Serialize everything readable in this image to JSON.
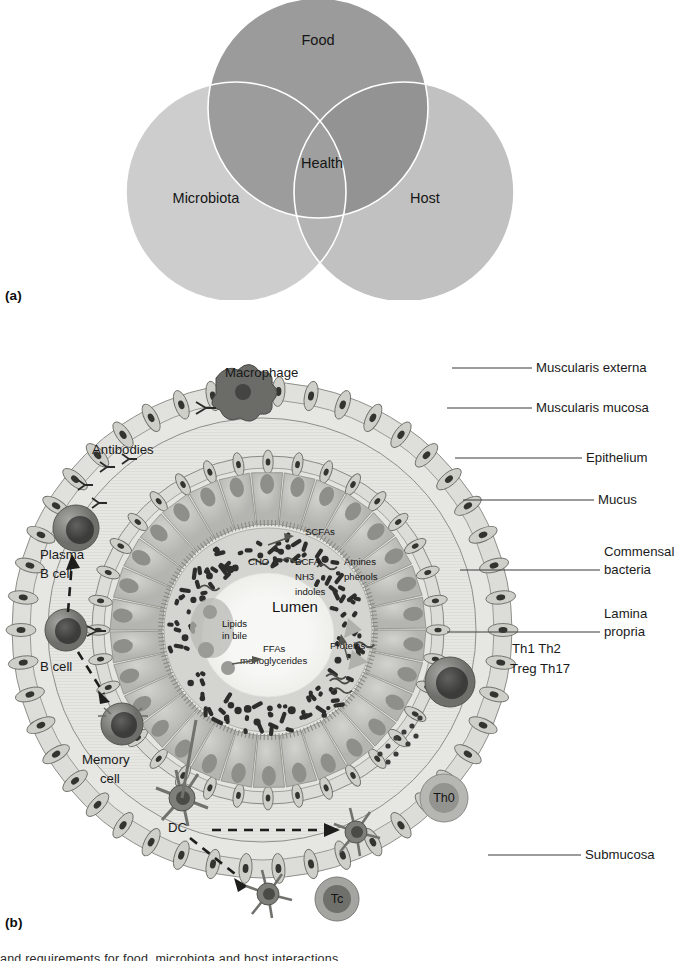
{
  "figure": {
    "panel_a_label": "(a)",
    "panel_b_label": "(b)"
  },
  "panel_a": {
    "title": "Venn diagram of Food, Microbiota, Host and Health",
    "circles": [
      {
        "id": "food",
        "label": "Food",
        "cx": 318,
        "cy": 108,
        "r": 110,
        "fill": "#9b9b9b"
      },
      {
        "id": "microbiota",
        "label": "Microbiota",
        "cx": 236,
        "cy": 192,
        "r": 110,
        "fill": "#c9c9c9"
      },
      {
        "id": "host",
        "label": "Host",
        "cx": 404,
        "cy": 192,
        "r": 110,
        "fill": "#bcbcbc"
      }
    ],
    "center_label": "Health",
    "outline_color": "#ffffff"
  },
  "panel_b": {
    "title": "Cross-section of the intestinal wall",
    "right_labels": [
      {
        "id": "muscularis-externa",
        "text": "Muscularis externa",
        "x": 536,
        "y": 372,
        "lx1": 452,
        "ly1": 368,
        "lx2": 532,
        "ly2": 368
      },
      {
        "id": "muscularis-mucosa",
        "text": "Muscularis mucosa",
        "x": 536,
        "y": 412,
        "lx1": 447,
        "ly1": 408,
        "lx2": 532,
        "ly2": 408
      },
      {
        "id": "epithelium",
        "text": "Epithelium",
        "x": 586,
        "y": 462,
        "lx1": 455,
        "ly1": 458,
        "lx2": 582,
        "ly2": 458
      },
      {
        "id": "mucus",
        "text": "Mucus",
        "x": 598,
        "y": 504,
        "lx1": 463,
        "ly1": 500,
        "lx2": 594,
        "ly2": 500
      },
      {
        "id": "commensal-bacteria",
        "text": "Commensal",
        "x": 604,
        "y": 556,
        "lx1": 460,
        "ly1": 570,
        "lx2": 600,
        "ly2": 570
      },
      {
        "id": "commensal-bacteria-2",
        "text": "bacteria",
        "x": 604,
        "y": 574,
        "lx1": 0,
        "ly1": 0,
        "lx2": 0,
        "ly2": 0
      },
      {
        "id": "lamina-propria",
        "text": "Lamina",
        "x": 604,
        "y": 618,
        "lx1": 447,
        "ly1": 632,
        "lx2": 600,
        "ly2": 632
      },
      {
        "id": "lamina-propria-2",
        "text": "propria",
        "x": 604,
        "y": 636,
        "lx1": 0,
        "ly1": 0,
        "lx2": 0,
        "ly2": 0
      },
      {
        "id": "submucosa",
        "text": "Submucosa",
        "x": 585,
        "y": 859,
        "lx1": 488,
        "ly1": 855,
        "lx2": 581,
        "ly2": 855
      }
    ],
    "inner_labels": [
      {
        "id": "macrophage",
        "text": "Macrophage",
        "x": 225,
        "y": 377,
        "size": 13.2
      },
      {
        "id": "antibodies",
        "text": "Antibodies",
        "x": 92,
        "y": 454,
        "size": 13.2
      },
      {
        "id": "plasma",
        "text": "Plasma",
        "x": 40,
        "y": 559,
        "size": 13.2
      },
      {
        "id": "plasma-bcell",
        "text": "B cell",
        "x": 40,
        "y": 578,
        "size": 13.2
      },
      {
        "id": "bcell",
        "text": "B cell",
        "x": 40,
        "y": 671,
        "size": 13.2
      },
      {
        "id": "memory",
        "text": "Memory",
        "x": 82,
        "y": 764,
        "size": 13.2
      },
      {
        "id": "memory-cell",
        "text": "cell",
        "x": 100,
        "y": 783,
        "size": 13.2
      },
      {
        "id": "dc",
        "text": "DC",
        "x": 168,
        "y": 832,
        "size": 13.2
      },
      {
        "id": "th-set-1",
        "text": "Th1  Th2",
        "x": 512,
        "y": 653,
        "size": 13.2
      },
      {
        "id": "th-set-2",
        "text": "Treg Th17",
        "x": 510,
        "y": 673,
        "size": 13.2
      }
    ],
    "cell_badges": [
      {
        "id": "th0",
        "text": "Th0",
        "cx": 444,
        "cy": 798
      },
      {
        "id": "tc",
        "text": "Tc",
        "cx": 337,
        "cy": 899
      }
    ],
    "lumen_labels": [
      {
        "id": "scfas",
        "text": "SCFAs",
        "x": 305,
        "y": 535,
        "size": 9.6
      },
      {
        "id": "cho",
        "text": "CHO",
        "x": 248,
        "y": 565,
        "size": 9.6
      },
      {
        "id": "bcfa",
        "text": "BCFA",
        "x": 295,
        "y": 565,
        "size": 9.6
      },
      {
        "id": "nh3",
        "text": "NH3",
        "x": 295,
        "y": 580,
        "size": 9.6
      },
      {
        "id": "indoles",
        "text": "indoles",
        "x": 295,
        "y": 595,
        "size": 9.6
      },
      {
        "id": "amines",
        "text": "Amines",
        "x": 344,
        "y": 565,
        "size": 9.6
      },
      {
        "id": "phenols",
        "text": "phenols",
        "x": 344,
        "y": 580,
        "size": 9.6
      },
      {
        "id": "lumen",
        "text": "Lumen",
        "x": 272,
        "y": 612,
        "size": 15
      },
      {
        "id": "lipids",
        "text": "Lipids",
        "x": 222,
        "y": 627,
        "size": 9.6
      },
      {
        "id": "in-bile",
        "text": "in bile",
        "x": 222,
        "y": 639,
        "size": 9.6
      },
      {
        "id": "ffas",
        "text": "FFAs",
        "x": 263,
        "y": 652,
        "size": 9.6
      },
      {
        "id": "monoglycerides",
        "text": "monoglycerides",
        "x": 240,
        "y": 664,
        "size": 9.6
      },
      {
        "id": "proteins",
        "text": "Proteins",
        "x": 330,
        "y": 649,
        "size": 10.5
      }
    ],
    "layers": {
      "muscularis_externa": {
        "r": 248,
        "fill": "#d8d8d4"
      },
      "submucosa": {
        "r": 215,
        "fill": "#e3e3e0"
      },
      "muscularis_mucosa": {
        "r": 168,
        "fill": "#d2d2ce"
      },
      "lamina_propria": {
        "r": 160,
        "fill": "#e0e0dc"
      },
      "epithelium": {
        "r": 138,
        "fill": "#c6c6c2"
      },
      "mucus": {
        "r": 100,
        "fill": "#cfcfcb"
      },
      "lumen": {
        "r": 66,
        "fill": "#f4f4f2"
      },
      "cx": 270,
      "cy": 640
    },
    "colors": {
      "tissue_light": "#e6e6e3",
      "tissue_mid": "#d0d0cc",
      "tissue_dark": "#a8a8a4",
      "nucleus": "#3a3a38",
      "bacteria": "#2e2e2c",
      "cell_body": "#8c8c8a",
      "cell_nucleus": "#5a5a58",
      "outline": "#6e6e6a"
    }
  },
  "caption": {
    "partial_text": "and requirements for food, microbiota and host interactions"
  }
}
